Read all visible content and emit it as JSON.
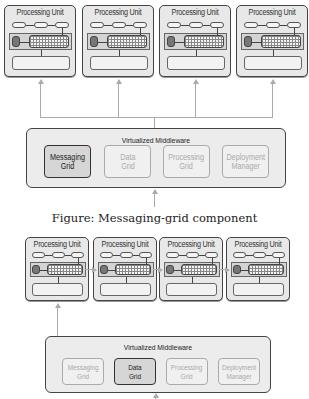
{
  "figure1": {
    "processing_units": [
      {
        "title": "Processing Unit"
      },
      {
        "title": "Processing Unit"
      },
      {
        "title": "Processing Unit"
      },
      {
        "title": "Processing Unit"
      }
    ],
    "middleware": {
      "title": "Virtualized Middleware",
      "components": [
        {
          "label": "Messaging\nGrid",
          "active": true
        },
        {
          "label": "Data\nGrid",
          "active": false
        },
        {
          "label": "Processing\nGrid",
          "active": false
        },
        {
          "label": "Deployment\nManager",
          "active": false
        }
      ]
    },
    "caption": "Figure: Messaging-grid component"
  },
  "figure2": {
    "processing_units": [
      {
        "title": "Processing Unit"
      },
      {
        "title": "Processing Unit"
      },
      {
        "title": "Processing Unit"
      },
      {
        "title": "Processing Unit"
      }
    ],
    "middleware": {
      "title": "Virtualized Middleware",
      "components": [
        {
          "label": "Messaging\nGrid",
          "active": false
        },
        {
          "label": "Data\nGrid",
          "active": true
        },
        {
          "label": "Processing\nGrid",
          "active": false
        },
        {
          "label": "Deployment\nManager",
          "active": false
        }
      ]
    }
  },
  "colors": {
    "box_border": "#444444",
    "box_fill": "#e8e8e8",
    "connector": "#aaaaaa",
    "inactive_text": "#aaaaaa"
  }
}
